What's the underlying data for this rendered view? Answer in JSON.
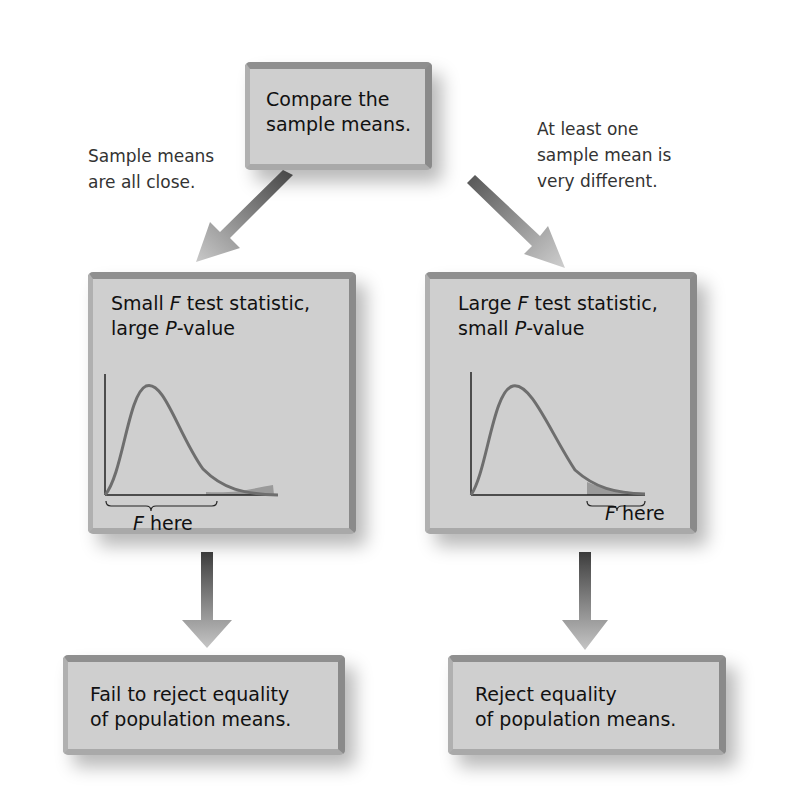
{
  "top_box": {
    "line1": "Compare the",
    "line2": "sample means."
  },
  "left_note": {
    "line1": "Sample means",
    "line2": "are all close."
  },
  "right_note": {
    "line1": "At least one",
    "line2": "sample mean is",
    "line3": "very different."
  },
  "left_panel": {
    "title_a": "Small ",
    "title_f": "F",
    "title_b": " test statistic,",
    "subtitle_a": "large ",
    "subtitle_p": "P",
    "subtitle_b": "-value",
    "region_f": "F",
    "region_label": " here"
  },
  "right_panel": {
    "title_a": "Large ",
    "title_f": "F",
    "title_b": " test statistic,",
    "subtitle_a": "small ",
    "subtitle_p": "P",
    "subtitle_b": "-value",
    "region_f": "F",
    "region_label": " here"
  },
  "bottom_left_box": {
    "line1": "Fail to reject equality",
    "line2": "of population means."
  },
  "bottom_right_box": {
    "line1": "Reject equality",
    "line2": "of population means."
  },
  "colors": {
    "box_fill": "#cfcfcf",
    "box_border": "#8f8f8f",
    "curve": "#6e6e6e",
    "arrow_dark": "#555555",
    "arrow_light": "#c8c8c8"
  }
}
